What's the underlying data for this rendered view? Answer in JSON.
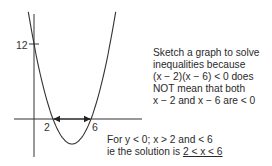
{
  "chart_data": {
    "type": "line",
    "title": "",
    "function": "y = (x - 2)(x - 6)",
    "xlabel": "",
    "ylabel": "",
    "x_tick_labels": [
      "2",
      "6"
    ],
    "y_tick_labels": [
      "12"
    ],
    "roots": [
      2,
      6
    ],
    "y_intercept": 12,
    "vertex": [
      4,
      -4
    ],
    "x": [
      -0.5,
      0,
      1,
      2,
      3,
      4,
      5,
      6,
      7,
      8.5
    ],
    "series": [
      {
        "name": "y = (x-2)(x-6)",
        "values": [
          16.25,
          12,
          5,
          0,
          -3,
          -4,
          -3,
          0,
          5,
          16.25
        ]
      }
    ],
    "annotations": [
      "double arrow between x = 2 and x = 6 on the x-axis"
    ],
    "grid": false
  },
  "graph": {
    "y_tick_label": "12",
    "x_tick_label_left": "2",
    "x_tick_label_right": "6"
  },
  "notes": {
    "top": [
      "Sketch a graph to solve",
      "inequalities because",
      "(x − 2)(x − 6) < 0 does",
      "NOT mean that both",
      "x − 2 and x − 6 are < 0"
    ],
    "bottom_line1": "For y < 0; x > 2 and < 6",
    "bottom_line2_prefix": "ie the solution is ",
    "bottom_line2_answer": "2 < x < 6"
  },
  "colors": {
    "ink": "#333333",
    "text": "#2a2a2a",
    "background": "#ffffff"
  }
}
